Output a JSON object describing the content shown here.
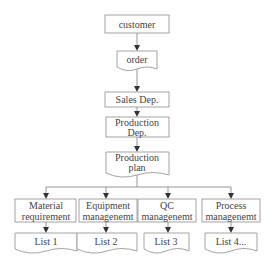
{
  "diagram": {
    "type": "flowchart",
    "nodes": {
      "customer": {
        "label": "customer",
        "shape": "rectangle"
      },
      "order": {
        "label": "order",
        "shape": "document"
      },
      "sales": {
        "label": "Sales Dep.",
        "shape": "rectangle"
      },
      "production_dep": {
        "line1": "Production",
        "line2": "Dep.",
        "shape": "rectangle"
      },
      "production_plan": {
        "line1": "Production",
        "line2": "plan",
        "shape": "document"
      },
      "material": {
        "line1": "Material",
        "line2": "requirement",
        "shape": "rectangle"
      },
      "equipment": {
        "line1": "Equipment",
        "line2": "managenemt",
        "shape": "rectangle"
      },
      "qc": {
        "line1": "QC",
        "line2": "managenemt",
        "shape": "rectangle"
      },
      "process": {
        "line1": "Process",
        "line2": "managenemt",
        "shape": "rectangle"
      },
      "list1": {
        "label": "List 1",
        "shape": "document"
      },
      "list2": {
        "label": "List 2",
        "shape": "document"
      },
      "list3": {
        "label": "List 3",
        "shape": "document"
      },
      "list4": {
        "label": "List 4...",
        "shape": "document"
      }
    },
    "edges": [
      {
        "from": "customer",
        "to": "order"
      },
      {
        "from": "order",
        "to": "sales"
      },
      {
        "from": "sales",
        "to": "production_dep"
      },
      {
        "from": "production_dep",
        "to": "production_plan"
      },
      {
        "from": "production_plan",
        "to": "material"
      },
      {
        "from": "production_plan",
        "to": "equipment"
      },
      {
        "from": "production_plan",
        "to": "qc"
      },
      {
        "from": "production_plan",
        "to": "process"
      },
      {
        "from": "material",
        "to": "list1"
      },
      {
        "from": "equipment",
        "to": "list2"
      },
      {
        "from": "qc",
        "to": "list3"
      },
      {
        "from": "process",
        "to": "list4"
      }
    ]
  }
}
